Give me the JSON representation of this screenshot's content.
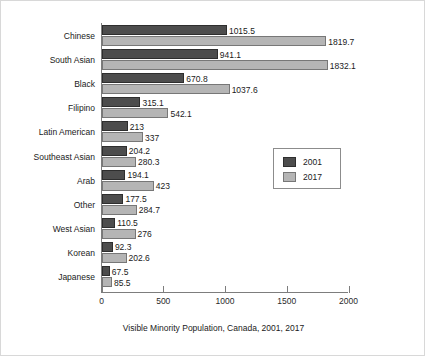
{
  "chart_data": {
    "type": "bar",
    "orientation": "horizontal",
    "title": "",
    "caption": "Visible Minority Population, Canada, 2001, 2017",
    "xlabel": "",
    "ylabel": "",
    "xlim": [
      0,
      2000
    ],
    "xticks": [
      0,
      500,
      1000,
      1500,
      2000
    ],
    "xtick_labels": [
      "0",
      "500",
      "1000",
      "1500",
      "2000"
    ],
    "grid": false,
    "legend_position": "center-right",
    "categories": [
      "Chinese",
      "South Asian",
      "Black",
      "Filipino",
      "Latin American",
      "Southeast Asian",
      "Arab",
      "Other",
      "West Asian",
      "Korean",
      "Japanese"
    ],
    "series": [
      {
        "name": "2001",
        "color": "#4d4d4d",
        "values": [
          1015.5,
          941.1,
          670.8,
          315.1,
          213,
          204.2,
          194.1,
          177.5,
          110.5,
          92.3,
          67.5
        ],
        "value_labels": [
          "1015.5",
          "941.1",
          "670.8",
          "315.1",
          "213",
          "204.2",
          "194.1",
          "177.5",
          "110.5",
          "92.3",
          "67.5"
        ]
      },
      {
        "name": "2017",
        "color": "#b5b5b5",
        "values": [
          1819.7,
          1832.1,
          1037.6,
          542.1,
          337,
          280.3,
          423,
          284.7,
          276,
          202.6,
          85.5
        ],
        "value_labels": [
          "1819.7",
          "1832.1",
          "1037.6",
          "542.1",
          "337",
          "280.3",
          "423",
          "284.7",
          "276",
          "202.6",
          "85.5"
        ]
      }
    ]
  },
  "legend": {
    "entries": [
      {
        "label": "2001",
        "color": "#4d4d4d"
      },
      {
        "label": "2017",
        "color": "#b5b5b5"
      }
    ]
  }
}
